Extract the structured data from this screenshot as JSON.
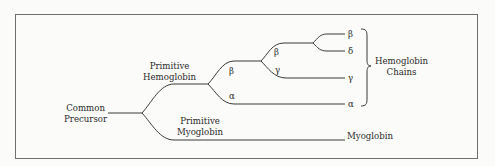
{
  "diagram": {
    "type": "phylogenetic-tree",
    "root": "Common Precursor",
    "labels": {
      "common_precursor_1": "Common",
      "common_precursor_2": "Precursor",
      "primitive_hemoglobin_1": "Primitive",
      "primitive_hemoglobin_2": "Hemoglobin",
      "primitive_myoglobin_1": "Primitive",
      "primitive_myoglobin_2": "Myoglobin",
      "hemoglobin_chains_1": "Hemoglobin",
      "hemoglobin_chains_2": "Chains",
      "myoglobin": "Myoglobin"
    },
    "branch_labels": {
      "beta_1": "β",
      "alpha_1": "α",
      "beta_2": "β",
      "gamma_1": "γ"
    },
    "leaves": {
      "beta": "β",
      "delta": "δ",
      "gamma": "γ",
      "alpha": "α"
    },
    "tree": {
      "name": "Common Precursor",
      "children": [
        {
          "name": "Primitive Hemoglobin",
          "children": [
            {
              "name": "β",
              "children": [
                {
                  "name": "β",
                  "children": [
                    {
                      "name": "β"
                    },
                    {
                      "name": "δ"
                    }
                  ]
                },
                {
                  "name": "γ"
                }
              ]
            },
            {
              "name": "α"
            }
          ]
        },
        {
          "name": "Primitive Myoglobin",
          "children": [
            {
              "name": "Myoglobin"
            }
          ]
        }
      ]
    },
    "group_bracket": "Hemoglobin Chains",
    "colors": {
      "line": "#3a3a3a",
      "frame": "#6f6f6f",
      "background": "#fbfbf9"
    }
  }
}
